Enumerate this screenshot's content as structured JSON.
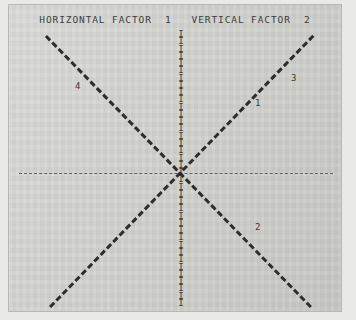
{
  "figure": {
    "title": "HORIZONTAL FACTOR  1   VERTICAL FACTOR  2",
    "background_color": "#d3d3cf",
    "ink_color": "#2d2d2b",
    "frame_color": "#b9b9b4"
  },
  "axes": {
    "horizontal": {
      "name": "horizontal-axis",
      "style": "dashed",
      "factor_number": "1"
    },
    "vertical": {
      "name": "vertical-axis",
      "style": "dashed-I-glyphs",
      "glyph": "I",
      "factor_number": "2"
    },
    "origin": {
      "x": 179,
      "y": 172
    }
  },
  "labels": [
    {
      "text": "4",
      "x": 74,
      "y": 80
    },
    {
      "text": "3",
      "x": 290,
      "y": 72
    },
    {
      "text": "1",
      "x": 254,
      "y": 97
    },
    {
      "text": "2",
      "x": 254,
      "y": 221
    }
  ],
  "chart_data": {
    "type": "line",
    "title": "HORIZONTAL FACTOR  1   VERTICAL FACTOR  2",
    "xlabel": "HORIZONTAL FACTOR 1",
    "ylabel": "VERTICAL FACTOR 2",
    "grid": false,
    "legend": "inline-numeric-labels",
    "xlim": [
      -1,
      1
    ],
    "ylim": [
      -1,
      1
    ],
    "series": [
      {
        "name": "1",
        "label": "1",
        "style": "thick-dashed",
        "points": [
          [
            -1,
            -1
          ],
          [
            1,
            1
          ]
        ],
        "quadrant": "lower-left-to-upper-right"
      },
      {
        "name": "2",
        "label": "2",
        "style": "thick-dashed",
        "points": [
          [
            -1,
            1
          ],
          [
            1,
            -1
          ]
        ],
        "quadrant": "upper-left-to-lower-right"
      },
      {
        "name": "3",
        "label": "3",
        "style": "thick-dashed",
        "points": [
          [
            0.52,
            0.72
          ],
          [
            1,
            1
          ]
        ],
        "quadrant": "upper-right"
      },
      {
        "name": "4",
        "label": "4",
        "style": "thick-dashed",
        "points": [
          [
            -1,
            1
          ],
          [
            -0.52,
            0.72
          ]
        ],
        "quadrant": "upper-left"
      }
    ],
    "axis_lines": [
      {
        "name": "horizontal",
        "y": 0,
        "style": "thin-dashed"
      },
      {
        "name": "vertical",
        "x": 0,
        "style": "I-glyph-dashed"
      }
    ]
  }
}
